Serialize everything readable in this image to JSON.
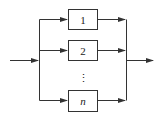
{
  "diagram": {
    "type": "parallel-system-block-diagram",
    "blocks": [
      {
        "label": "1",
        "italic": false
      },
      {
        "label": "2",
        "italic": false
      },
      {
        "label": "n",
        "italic": true
      }
    ],
    "ellipsis": "⋮",
    "colors": {
      "stroke": "#333333",
      "background": "#ffffff"
    }
  }
}
